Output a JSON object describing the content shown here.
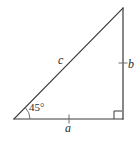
{
  "figure": {
    "name": "right-triangle-45-degree",
    "background_color": "#ffffff",
    "stroke_color": "#3a3a3a",
    "stroke_width": 1.2,
    "label_color": "#2b2b2b"
  },
  "geometry": {
    "vertices": {
      "bottom_left": {
        "x": 14,
        "y": 119
      },
      "bottom_right": {
        "x": 123,
        "y": 119
      },
      "top_right": {
        "x": 123,
        "y": 8
      }
    },
    "angle_arc": {
      "cx": 14,
      "cy": 119,
      "radius": 16
    },
    "right_angle_marker": {
      "x": 114,
      "y": 110,
      "size": 8
    },
    "tick_base": {
      "x": 69,
      "y": 119,
      "length": 9
    },
    "tick_vertical": {
      "x": 123,
      "y": 63,
      "length": 9
    }
  },
  "labels": {
    "hypotenuse": "c",
    "vertical_side": "b",
    "base_side": "a",
    "angle": "45°"
  }
}
